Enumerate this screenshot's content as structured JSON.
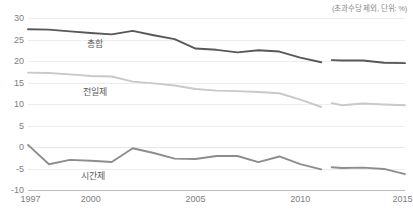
{
  "note": "(초과수당 제외, 단위: %)",
  "chart_data": {
    "type": "line",
    "title": "",
    "subtitle": "",
    "xlabel": "",
    "ylabel": "",
    "unit_note": "(초과수당 제외, 단위: %)",
    "grid": true,
    "legend_position": "inline-labels",
    "xlim": [
      1997,
      2015
    ],
    "ylim": [
      -10,
      30
    ],
    "yticks": [
      30,
      25,
      20,
      15,
      10,
      5,
      0,
      -5,
      -10
    ],
    "xticks": [
      1997,
      2000,
      2005,
      2010,
      2015
    ],
    "x": [
      1997,
      1998,
      1999,
      2000,
      2001,
      2002,
      2003,
      2004,
      2005,
      2006,
      2007,
      2008,
      2009,
      2010,
      2011,
      2011.5,
      2012,
      2013,
      2014,
      2015
    ],
    "series": [
      {
        "name": "총합",
        "color": "#58585a",
        "label_x": 2000.2,
        "label_y": 24.2,
        "break_after_index": 14,
        "values": [
          27.4,
          27.3,
          26.9,
          26.5,
          26.2,
          27.0,
          26.0,
          25.1,
          22.9,
          22.6,
          22.0,
          22.5,
          22.2,
          20.8,
          19.7,
          20.2,
          20.1,
          20.1,
          19.6,
          19.5
        ]
      },
      {
        "name": "전일제",
        "color": "#c9c9c9",
        "label_x": 2000.2,
        "label_y": 13.0,
        "break_after_index": 14,
        "values": [
          17.3,
          17.2,
          16.9,
          16.5,
          16.4,
          15.2,
          14.8,
          14.3,
          13.5,
          13.1,
          13.0,
          12.8,
          12.5,
          11.0,
          9.3,
          10.2,
          9.7,
          10.1,
          9.9,
          9.7
        ]
      },
      {
        "name": "시간제",
        "color": "#8d8d8d",
        "label_x": 2000.1,
        "label_y": -6.5,
        "break_after_index": 14,
        "values": [
          0.5,
          -4.0,
          -3.0,
          -3.2,
          -3.5,
          -0.3,
          -1.4,
          -2.7,
          -2.8,
          -2.1,
          -2.1,
          -3.5,
          -2.2,
          -4.0,
          -5.2,
          -4.7,
          -4.9,
          -4.8,
          -5.1,
          -6.3
        ]
      }
    ]
  },
  "axis": {
    "y_ticks": [
      "30",
      "25",
      "20",
      "15",
      "10",
      "5",
      "0",
      "-5",
      "-10"
    ],
    "x_ticks": [
      "1997",
      "2000",
      "2005",
      "2010",
      "2015"
    ]
  }
}
